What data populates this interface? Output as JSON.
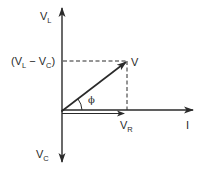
{
  "diagram": {
    "type": "phasor-diagram",
    "colors": {
      "ink": "#2a2a2a",
      "background": "#ffffff"
    },
    "labels": {
      "v_l": {
        "main": "V",
        "sub": "L"
      },
      "v_l_minus_v_c": {
        "open": "(V",
        "sub1": "L",
        "mid": " − V",
        "sub2": "C",
        "close": ")"
      },
      "v": "V",
      "phi": "ϕ",
      "v_r": {
        "main": "V",
        "sub": "R"
      },
      "i": "I",
      "v_c": {
        "main": "V",
        "sub": "C"
      }
    },
    "vectors": [
      {
        "name": "V_L axis",
        "direction": "up"
      },
      {
        "name": "V_C axis",
        "direction": "down"
      },
      {
        "name": "I axis",
        "direction": "right"
      },
      {
        "name": "V_R",
        "direction": "right"
      },
      {
        "name": "V",
        "direction": "up-right"
      }
    ]
  }
}
